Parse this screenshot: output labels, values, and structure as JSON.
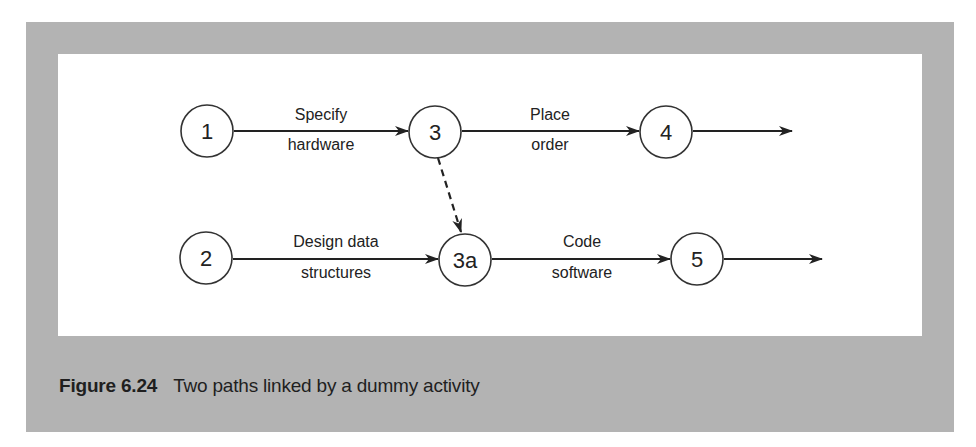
{
  "figure": {
    "number": "Figure 6.24",
    "caption": "Two paths linked by a dummy activity"
  },
  "colors": {
    "frame": "#b3b3b3",
    "canvas": "#ffffff",
    "ink": "#222222"
  },
  "diagram": {
    "nodes": [
      {
        "id": "1",
        "label": "1"
      },
      {
        "id": "3",
        "label": "3"
      },
      {
        "id": "4",
        "label": "4"
      },
      {
        "id": "2",
        "label": "2"
      },
      {
        "id": "3a",
        "label": "3a"
      },
      {
        "id": "5",
        "label": "5"
      }
    ],
    "edges": [
      {
        "from": "1",
        "to": "3",
        "line1": "Specify",
        "line2": "hardware",
        "style": "solid"
      },
      {
        "from": "3",
        "to": "4",
        "line1": "Place",
        "line2": "order",
        "style": "solid"
      },
      {
        "from": "4",
        "to": "out",
        "line1": "",
        "line2": "",
        "style": "solid"
      },
      {
        "from": "2",
        "to": "3a",
        "line1": "Design data",
        "line2": "structures",
        "style": "solid"
      },
      {
        "from": "3a",
        "to": "5",
        "line1": "Code",
        "line2": "software",
        "style": "solid"
      },
      {
        "from": "5",
        "to": "out",
        "line1": "",
        "line2": "",
        "style": "solid"
      },
      {
        "from": "3",
        "to": "3a",
        "line1": "",
        "line2": "",
        "style": "dashed",
        "note": "dummy activity"
      }
    ]
  }
}
